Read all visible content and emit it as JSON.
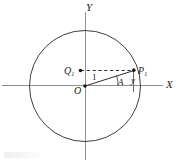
{
  "figure": {
    "kind": "unit-circle-trigonometry-diagram",
    "background_color": "#ffffff",
    "stroke_color": "#3a3a3a",
    "axis_color": "#8a8a8a",
    "label_color": "#1c1c1c",
    "axes": {
      "x_label": "X",
      "y_label": "Y",
      "origin_label": "O"
    },
    "circle": {
      "center_x": 85,
      "center_y": 86,
      "radius": 56,
      "description": "unit circle centered at origin"
    },
    "points": [
      {
        "id": "P1",
        "label": "P",
        "subscript": "1",
        "x": 134,
        "y": 70
      },
      {
        "id": "Q1",
        "label": "Q",
        "subscript": "1",
        "x": 80,
        "y": 71
      },
      {
        "id": "O",
        "label": "O",
        "subscript": "",
        "x": 85,
        "y": 86
      }
    ],
    "segments": {
      "radius_label": "1",
      "angle_label": "A",
      "height_label": "y",
      "dashed_label": "Q1 to P1 horizontal dashed"
    }
  }
}
